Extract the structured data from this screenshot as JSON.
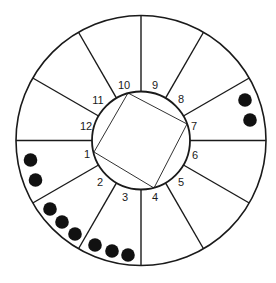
{
  "diagram": {
    "type": "house-wheel",
    "center": [
      141,
      140.5
    ],
    "outer_radius": 125,
    "inner_radius": 49,
    "stroke_color": "#1a1a1a",
    "dot_color": "#111111",
    "spoke_angles_deg": [
      0,
      30,
      60,
      90,
      120,
      150,
      180,
      210,
      240,
      270,
      300,
      330
    ],
    "square": {
      "vertices": [
        [
          128,
          93
        ],
        [
          187,
          124
        ],
        [
          154,
          188
        ],
        [
          94,
          152
        ]
      ],
      "vertex_labels": [
        "10",
        "7",
        "4",
        "1"
      ]
    },
    "labels": [
      {
        "text": "1",
        "x": 87,
        "y": 155
      },
      {
        "text": "2",
        "x": 100,
        "y": 183
      },
      {
        "text": "3",
        "x": 125,
        "y": 198
      },
      {
        "text": "4",
        "x": 155,
        "y": 198
      },
      {
        "text": "5",
        "x": 181,
        "y": 183
      },
      {
        "text": "6",
        "x": 195,
        "y": 156
      },
      {
        "text": "7",
        "x": 194,
        "y": 127
      },
      {
        "text": "8",
        "x": 181,
        "y": 100
      },
      {
        "text": "9",
        "x": 155,
        "y": 86
      },
      {
        "text": "10",
        "x": 124,
        "y": 86
      },
      {
        "text": "11",
        "x": 98,
        "y": 101
      },
      {
        "text": "12",
        "x": 86,
        "y": 127
      }
    ],
    "dot_groups": [
      {
        "house": "1",
        "count": 2,
        "dots": [
          [
            30.5,
            160
          ],
          [
            35.5,
            180
          ]
        ]
      },
      {
        "house": "2",
        "count": 3,
        "dots": [
          [
            50,
            209
          ],
          [
            62,
            222
          ],
          [
            75,
            234
          ]
        ]
      },
      {
        "house": "3",
        "count": 3,
        "dots": [
          [
            95,
            245
          ],
          [
            112,
            251
          ],
          [
            128,
            255
          ]
        ]
      },
      {
        "house": "7",
        "count": 2,
        "dots": [
          [
            245,
            100
          ],
          [
            250,
            120
          ]
        ]
      }
    ],
    "dot_radius": 6.8
  }
}
